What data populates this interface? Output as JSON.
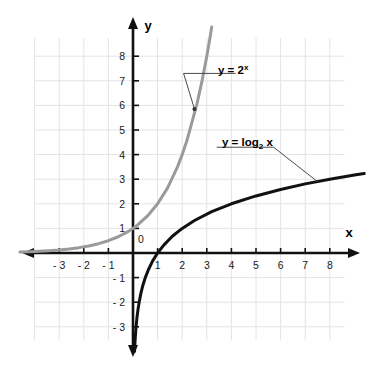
{
  "chart_data": {
    "type": "line",
    "title": "",
    "xlabel": "x",
    "ylabel": "y",
    "xlim": [
      -4.6,
      9.4
    ],
    "ylim": [
      -4.1,
      9.2
    ],
    "grid": true,
    "grid_color": "#e4e4e4",
    "legend_position": "inline-annotations",
    "axis_color": "#111111",
    "x_ticks": [
      -3,
      -2,
      -1,
      1,
      2,
      3,
      4,
      5,
      6,
      7,
      8
    ],
    "y_ticks": [
      -3,
      -2,
      -1,
      1,
      2,
      3,
      4,
      5,
      6,
      7,
      8
    ],
    "x_tick_labels": [
      "- 3",
      "- 2",
      "- 1",
      "1",
      "2",
      "3",
      "4",
      "5",
      "6",
      "7",
      "8"
    ],
    "y_tick_labels": [
      "- 3",
      "- 2",
      "- 1",
      "1",
      "2",
      "3",
      "4",
      "5",
      "6",
      "7",
      "8"
    ],
    "origin_label": "0",
    "series": [
      {
        "name": "y = 2^x",
        "label_text": "y = 2",
        "label_exponent": "x",
        "label_kind": "superscript",
        "color": "#9a9a9a",
        "linewidth": 3,
        "function": "2^x",
        "points": [
          [
            -4.6,
            0.041
          ],
          [
            -4.2,
            0.054
          ],
          [
            -3.8,
            0.072
          ],
          [
            -3.4,
            0.095
          ],
          [
            -3.0,
            0.125
          ],
          [
            -2.6,
            0.165
          ],
          [
            -2.2,
            0.218
          ],
          [
            -1.8,
            0.287
          ],
          [
            -1.4,
            0.379
          ],
          [
            -1.0,
            0.5
          ],
          [
            -0.6,
            0.66
          ],
          [
            -0.2,
            0.871
          ],
          [
            0.0,
            1.0
          ],
          [
            0.2,
            1.149
          ],
          [
            0.6,
            1.516
          ],
          [
            1.0,
            2.0
          ],
          [
            1.4,
            2.639
          ],
          [
            1.8,
            3.482
          ],
          [
            2.0,
            4.0
          ],
          [
            2.2,
            4.595
          ],
          [
            2.6,
            6.063
          ],
          [
            2.8,
            6.964
          ],
          [
            3.0,
            8.0
          ],
          [
            3.15,
            8.875
          ],
          [
            3.2,
            9.19
          ]
        ]
      },
      {
        "name": "y = log2 x",
        "label_text": "y = log",
        "label_subscript": "2",
        "label_suffix": " x",
        "label_kind": "subscript",
        "color": "#111111",
        "linewidth": 3,
        "function": "log2(x)",
        "points": [
          [
            0.063,
            -4.0
          ],
          [
            0.075,
            -3.74
          ],
          [
            0.09,
            -3.47
          ],
          [
            0.11,
            -3.18
          ],
          [
            0.135,
            -2.89
          ],
          [
            0.165,
            -2.6
          ],
          [
            0.2,
            -2.32
          ],
          [
            0.25,
            -2.0
          ],
          [
            0.32,
            -1.64
          ],
          [
            0.4,
            -1.32
          ],
          [
            0.5,
            -1.0
          ],
          [
            0.63,
            -0.67
          ],
          [
            0.8,
            -0.32
          ],
          [
            1.0,
            0.0
          ],
          [
            1.26,
            0.33
          ],
          [
            1.6,
            0.68
          ],
          [
            2.0,
            1.0
          ],
          [
            2.5,
            1.32
          ],
          [
            3.2,
            1.68
          ],
          [
            4.0,
            2.0
          ],
          [
            5.0,
            2.32
          ],
          [
            6.0,
            2.58
          ],
          [
            7.0,
            2.81
          ],
          [
            8.0,
            3.0
          ],
          [
            9.0,
            3.17
          ],
          [
            9.4,
            3.23
          ]
        ]
      }
    ],
    "annotations": [
      {
        "name": "exponential-callout",
        "text": "y = 2^x",
        "anchor_point": [
          2.5,
          5.85
        ],
        "label_position": [
          2.3,
          7.3
        ]
      },
      {
        "name": "logarithmic-callout",
        "text": "y = log2 x",
        "anchor_point": [
          7.5,
          2.9
        ],
        "label_position": [
          3.4,
          4.3
        ]
      }
    ]
  },
  "axes": {
    "x_axis_name": "x",
    "y_axis_name": "y",
    "origin_label": "0"
  },
  "labels": {
    "exponential": {
      "base": "y = 2",
      "exponent": "x"
    },
    "logarithmic": {
      "prefix": "y = log",
      "subscript": "2",
      "suffix": " x"
    }
  },
  "ticks": {
    "x_negative": [
      "- 3",
      "- 2",
      "- 1"
    ],
    "x_positive": [
      "1",
      "2",
      "3",
      "4",
      "5",
      "6",
      "7",
      "8"
    ],
    "y_negative": [
      "- 1",
      "- 2",
      "- 3"
    ],
    "y_positive": [
      "1",
      "2",
      "3",
      "4",
      "5",
      "6",
      "7",
      "8"
    ]
  },
  "colors": {
    "exponential_curve": "#9a9a9a",
    "logarithmic_curve": "#111111",
    "axis": "#111111",
    "grid": "#e4e4e4",
    "background": "#ffffff",
    "text": "#1a1a1a"
  }
}
